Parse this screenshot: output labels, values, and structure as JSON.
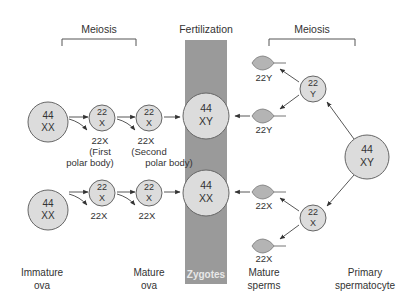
{
  "header": {
    "meiosis_left": "Meiosis",
    "fertilization": "Fertilization",
    "meiosis_right": "Meiosis"
  },
  "colors": {
    "zygote_band": "#9a9a9a",
    "cell_fill": "#dcdcdc",
    "sperm_fill": "#b4b4b4",
    "stroke": "#666666"
  },
  "oogenesis": {
    "row1": {
      "immature": {
        "top": "44",
        "bottom": "XX"
      },
      "secondary": {
        "top": "22",
        "bottom": "X"
      },
      "mature": {
        "top": "22",
        "bottom": "X"
      },
      "polar1": {
        "line1": "22X",
        "line2": "(First",
        "line3": "polar body)"
      },
      "polar2": {
        "line1": "22X",
        "line2": "(Second",
        "line3": "polar body)"
      }
    },
    "row2": {
      "immature": {
        "top": "44",
        "bottom": "XX"
      },
      "secondary": {
        "top": "22",
        "bottom": "X"
      },
      "mature": {
        "top": "22",
        "bottom": "X"
      },
      "polar1": "22X",
      "polar2": "22X"
    }
  },
  "zygotes": {
    "top": {
      "top": "44",
      "bottom": "XY"
    },
    "bottom": {
      "top": "44",
      "bottom": "XX"
    },
    "band_label": "Zygotes"
  },
  "spermatogenesis": {
    "primary": {
      "top": "44",
      "bottom": "XY"
    },
    "secondary_y": {
      "top": "22",
      "bottom": "Y"
    },
    "secondary_x": {
      "top": "22",
      "bottom": "X"
    },
    "sperms": [
      "22Y",
      "22Y",
      "22X",
      "22X"
    ]
  },
  "footer": {
    "immature_ova": {
      "line1": "Immature",
      "line2": "ova"
    },
    "mature_ova": {
      "line1": "Mature",
      "line2": "ova"
    },
    "mature_sperms": {
      "line1": "Mature",
      "line2": "sperms"
    },
    "primary_spermatocyte": {
      "line1": "Primary",
      "line2": "spermatocyte"
    }
  }
}
